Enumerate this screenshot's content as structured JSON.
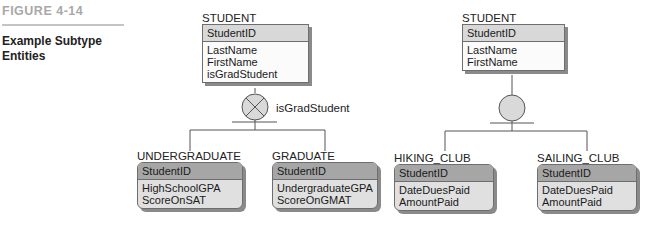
{
  "figure": {
    "number": "FIGURE 4-14",
    "caption": "Example Subtype Entities"
  },
  "left_diagram": {
    "supertype": {
      "name": "STUDENT",
      "identifier": "StudentID",
      "attributes": [
        "LastName",
        "FirstName",
        "isGradStudent"
      ]
    },
    "discriminator": "isGradStudent",
    "relationship_symbol": "exclusive-circle-x",
    "subtypes": [
      {
        "name": "UNDERGRADUATE",
        "identifier": "StudentID",
        "attributes": [
          "HighSchoolGPA",
          "ScoreOnSAT"
        ]
      },
      {
        "name": "GRADUATE",
        "identifier": "StudentID",
        "attributes": [
          "UndergraduateGPA",
          "ScoreOnGMAT"
        ]
      }
    ]
  },
  "right_diagram": {
    "supertype": {
      "name": "STUDENT",
      "identifier": "StudentID",
      "attributes": [
        "LastName",
        "FirstName"
      ]
    },
    "relationship_symbol": "inclusive-circle",
    "subtypes": [
      {
        "name": "HIKING_CLUB",
        "identifier": "StudentID",
        "attributes": [
          "DateDuesPaid",
          "AmountPaid"
        ]
      },
      {
        "name": "SAILING_CLUB",
        "identifier": "StudentID",
        "attributes": [
          "DateDuesPaid",
          "AmountPaid"
        ]
      }
    ]
  },
  "colors": {
    "line": "#555555",
    "circle_fill": "#d9d9d9",
    "supertype_header": "#d8d8d8",
    "subtype_header": "#a6a6a6",
    "subtype_body": "#e0e0e0"
  }
}
